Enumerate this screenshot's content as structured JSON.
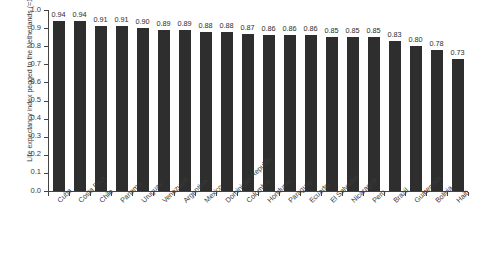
{
  "chart_data": {
    "type": "bar",
    "title": "",
    "xlabel": "",
    "ylabel": "Life expectancy index pegged to the Netherlands (=1)",
    "ylim": [
      0.0,
      1.0
    ],
    "grid": false,
    "legend": null,
    "bar_color": "#2e2e2e",
    "axis_color": "#444444",
    "y_ticks": [
      "1.0",
      "0.9",
      "0.8",
      "0.7",
      "0.6",
      "0.5",
      "0.4",
      "0.3",
      "0.2",
      "0.1",
      "0.0"
    ],
    "categories": [
      "Cuba",
      "Costa Rica",
      "Chile",
      "Panama",
      "Uruguay",
      "Venezuela",
      "Argentina",
      "Mexico",
      "Dominican Republic",
      "Colombia",
      "Honduras",
      "Paraguay",
      "Ecuador",
      "El Salvador",
      "Nicaragua",
      "Peru",
      "Brazil",
      "Guatemala",
      "Bolivia",
      "Haiti"
    ],
    "values": [
      0.94,
      0.94,
      0.91,
      0.91,
      0.9,
      0.89,
      0.89,
      0.88,
      0.88,
      0.87,
      0.86,
      0.86,
      0.86,
      0.85,
      0.85,
      0.85,
      0.83,
      0.8,
      0.78,
      0.73
    ],
    "value_labels": [
      "0.94",
      "0.94",
      "0.91",
      "0.91",
      "0.90",
      "0.89",
      "0.89",
      "0.88",
      "0.88",
      "0.87",
      "0.86",
      "0.86",
      "0.86",
      "0.85",
      "0.85",
      "0.85",
      "0.83",
      "0.80",
      "0.78",
      "0.73"
    ]
  }
}
